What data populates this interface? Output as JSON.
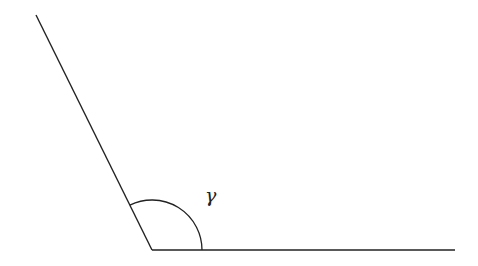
{
  "diagram": {
    "width": 478,
    "height": 266,
    "stroke_color": "#222222",
    "background": "#ffffff",
    "vertex": {
      "x": 152,
      "y": 250
    },
    "ray_left": {
      "x1": 152,
      "y1": 250,
      "x2": 36,
      "y2": 15
    },
    "ray_right": {
      "x1": 152,
      "y1": 250,
      "x2": 455,
      "y2": 250
    },
    "arc": {
      "radius": 50
    },
    "angle_label": {
      "text": "γ",
      "x": 205,
      "y": 186
    }
  }
}
